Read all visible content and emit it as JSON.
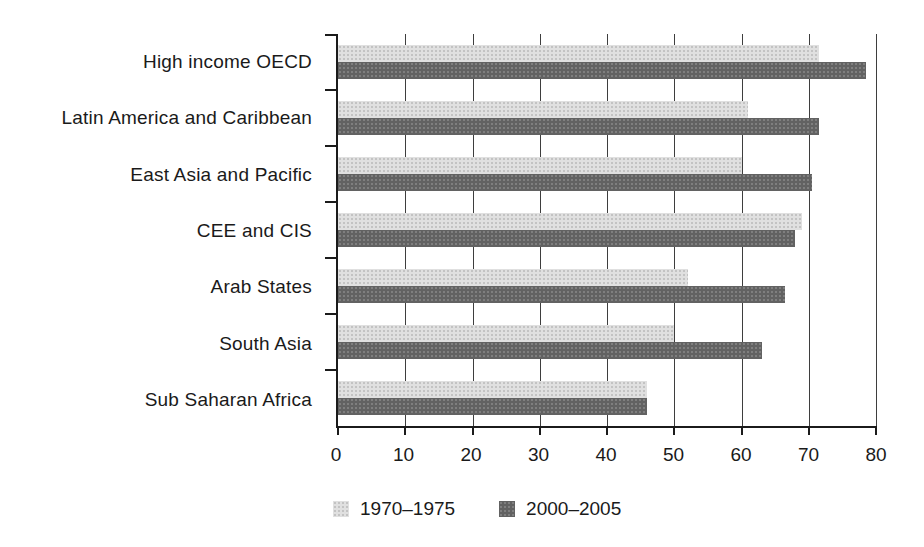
{
  "chart_data": {
    "type": "bar",
    "orientation": "horizontal",
    "title": "",
    "xlabel": "",
    "ylabel": "",
    "categories": [
      "High income OECD",
      "Latin America and Caribbean",
      "East Asia and Pacific",
      "CEE and CIS",
      "Arab States",
      "South Asia",
      "Sub Saharan Africa"
    ],
    "series": [
      {
        "name": "1970–1975",
        "color": "#dcdcdc",
        "values": [
          71.5,
          61.0,
          60.0,
          69.0,
          52.0,
          50.0,
          46.0
        ]
      },
      {
        "name": "2000–2005",
        "color": "#6b6b6b",
        "values": [
          78.5,
          71.5,
          70.5,
          68.0,
          66.5,
          63.0,
          46.0
        ]
      }
    ],
    "xlim": [
      0,
      80
    ],
    "x_ticks": [
      0,
      10,
      20,
      30,
      40,
      50,
      60,
      70,
      80
    ],
    "grid": "vertical-gridlines-on",
    "legend_position": "bottom"
  },
  "legend": {
    "items": [
      {
        "label": "1970–1975",
        "swatch": "light-gray-halftone"
      },
      {
        "label": "2000–2005",
        "swatch": "dark-gray-halftone"
      }
    ]
  },
  "colors": {
    "series_1970_1975": "#dcdcdc",
    "series_2000_2005": "#6b6b6b",
    "axis_line": "#1b1b1b",
    "gridline": "#3e3e3e",
    "background": "#ffffff",
    "text": "#1a1a1a"
  }
}
